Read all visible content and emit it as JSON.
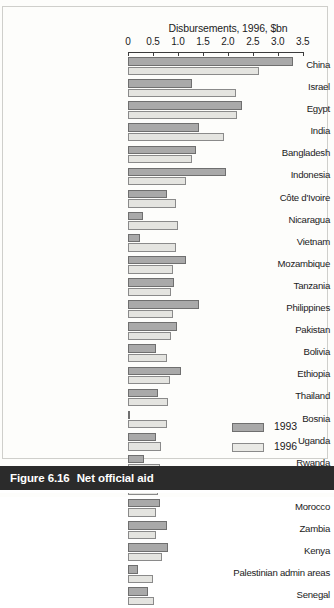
{
  "figure": {
    "caption_number": "Figure 6.16",
    "caption_text": "Net official aid"
  },
  "legend": {
    "position": "bottom-right",
    "entries": [
      {
        "label": "1993",
        "swatch": "dark-grey-swatch",
        "color": "#a9a9a9"
      },
      {
        "label": "1996",
        "swatch": "light-grey-swatch",
        "color": "#e9e9e5"
      }
    ]
  },
  "chart_data": {
    "type": "bar",
    "orientation": "horizontal",
    "title": "Disbursements, 1996, $bn",
    "subtitle": "",
    "xlabel": "Disbursements, 1996, $bn",
    "ylabel": "",
    "xlim": [
      0,
      3.5
    ],
    "xticks": [
      0,
      0.5,
      1.0,
      1.5,
      2.0,
      2.5,
      3.0,
      3.5
    ],
    "xtick_labels": [
      "0",
      "0.5",
      "1.0",
      "1.5",
      "2.0",
      "2.5",
      "3.0",
      "3.5"
    ],
    "grid": false,
    "legend_position": "bottom-right",
    "categories": [
      "China",
      "Israel",
      "Egypt",
      "India",
      "Bangladesh",
      "Indonesia",
      "Côte d'Ivoire",
      "Nicaragua",
      "Vietnam",
      "Mozambique",
      "Tanzania",
      "Philippines",
      "Pakistan",
      "Bolivia",
      "Ethiopia",
      "Thailand",
      "Bosnia",
      "Uganda",
      "Rwanda",
      "Ghana",
      "Morocco",
      "Zambia",
      "Kenya",
      "Palestinian admin areas",
      "Senegal"
    ],
    "series": [
      {
        "name": "1993",
        "color": "#a9a9a9",
        "values": [
          3.3,
          1.28,
          2.29,
          1.42,
          1.36,
          1.96,
          0.79,
          0.31,
          0.24,
          1.16,
          0.93,
          1.42,
          0.98,
          0.57,
          1.06,
          0.61,
          0.03,
          0.57,
          0.33,
          0.53,
          0.64,
          0.78,
          0.8,
          0.21,
          0.41
        ]
      },
      {
        "name": "1996",
        "color": "#e4e4e0",
        "values": [
          2.63,
          2.16,
          2.19,
          1.92,
          1.28,
          1.16,
          0.96,
          1.0,
          0.96,
          0.91,
          0.87,
          0.9,
          0.87,
          0.78,
          0.84,
          0.8,
          0.78,
          0.66,
          0.64,
          0.61,
          0.57,
          0.57,
          0.69,
          0.51,
          0.53
        ]
      }
    ]
  }
}
